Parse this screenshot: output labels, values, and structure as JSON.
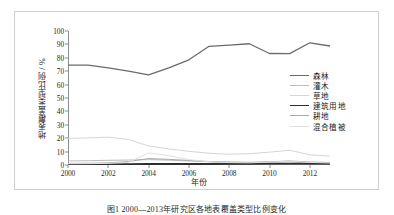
{
  "figure": {
    "caption": "图1  2000—2013年研究区各地表覆盖类型比例变化"
  },
  "chart_data": {
    "type": "line",
    "title": "",
    "xlabel": "年份",
    "ylabel": "地表覆盖类型比例 / %",
    "xlim": [
      2000,
      2013
    ],
    "ylim": [
      0,
      100
    ],
    "grid": false,
    "legend_position": "right-center",
    "x": [
      2000,
      2001,
      2002,
      2003,
      2004,
      2005,
      2006,
      2007,
      2008,
      2009,
      2010,
      2011,
      2012,
      2013
    ],
    "xticks": [
      2000,
      2002,
      2004,
      2006,
      2008,
      2010,
      2012
    ],
    "yticks": [
      0,
      10,
      20,
      30,
      40,
      50,
      60,
      70,
      80,
      90,
      100
    ],
    "series": [
      {
        "name": "森林",
        "color": "#6b6b6b",
        "width": 1.3,
        "values": [
          74.5,
          74.6,
          72.5,
          70.0,
          67.2,
          72.5,
          78.5,
          88.6,
          89.5,
          90.5,
          83.2,
          83.1,
          91.2,
          88.8
        ]
      },
      {
        "name": "灌木",
        "color": "#bcbcbc",
        "width": 1.0,
        "values": [
          3.0,
          3.2,
          3.5,
          3.7,
          4.0,
          3.6,
          3.0,
          2.4,
          2.0,
          1.8,
          2.1,
          2.6,
          1.8,
          1.6
        ]
      },
      {
        "name": "草地",
        "color": "#d6d6d6",
        "width": 1.0,
        "values": [
          19.8,
          20.2,
          20.8,
          19.0,
          14.2,
          12.0,
          10.2,
          8.8,
          8.0,
          8.4,
          9.6,
          11.0,
          7.6,
          6.6
        ]
      },
      {
        "name": "建筑用地",
        "color": "#2e2e2e",
        "width": 1.9,
        "values": [
          0.5,
          0.5,
          0.6,
          0.6,
          0.7,
          0.7,
          0.8,
          0.8,
          0.9,
          0.9,
          1.0,
          1.0,
          1.1,
          1.1
        ]
      },
      {
        "name": "耕地",
        "color": "#a8a8a8",
        "width": 1.0,
        "values": [
          1.2,
          1.3,
          1.6,
          2.6,
          4.8,
          4.2,
          3.4,
          2.6,
          2.2,
          2.0,
          2.4,
          3.0,
          2.2,
          1.9
        ]
      },
      {
        "name": "混合植被",
        "color": "#e0e0e0",
        "width": 1.0,
        "values": [
          0.9,
          1.0,
          1.2,
          2.0,
          9.0,
          7.0,
          4.0,
          2.4,
          1.8,
          1.6,
          2.2,
          2.8,
          1.9,
          1.5
        ]
      }
    ]
  }
}
